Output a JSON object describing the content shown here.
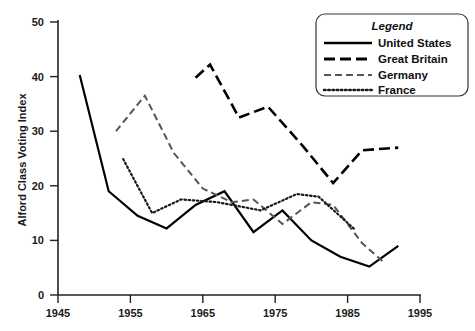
{
  "chart_data": {
    "type": "line",
    "title": "",
    "xlabel": "",
    "ylabel": "Alford Class Voting Index",
    "xlim": [
      1945,
      1995
    ],
    "ylim": [
      0,
      50
    ],
    "xticks": [
      1945,
      1955,
      1965,
      1975,
      1985,
      1995
    ],
    "yticks": [
      0,
      10,
      20,
      30,
      40,
      50
    ],
    "grid": false,
    "legend_position": "top-right",
    "legend_title": "Legend",
    "series": [
      {
        "name": "United States",
        "style": "solid",
        "color": "#000000",
        "x": [
          1948,
          1952,
          1956,
          1960,
          1964,
          1968,
          1972,
          1976,
          1980,
          1984,
          1988,
          1992
        ],
        "y": [
          40.3,
          19.0,
          14.5,
          12.2,
          16.5,
          19.0,
          11.5,
          15.5,
          10.0,
          7.0,
          5.2,
          9.0
        ]
      },
      {
        "name": "Great Britain",
        "style": "long-dash",
        "color": "#000000",
        "x": [
          1964,
          1966,
          1970,
          1974,
          1979,
          1983,
          1987,
          1992
        ],
        "y": [
          39.8,
          42.2,
          32.5,
          34.5,
          27.0,
          20.5,
          26.5,
          27.0
        ]
      },
      {
        "name": "Germany",
        "style": "dash",
        "color": "#555555",
        "x": [
          1953,
          1957,
          1961,
          1965,
          1969,
          1972,
          1976,
          1980,
          1983,
          1987,
          1990
        ],
        "y": [
          30.0,
          36.5,
          26.0,
          19.5,
          17.0,
          17.5,
          13.0,
          17.0,
          16.5,
          9.5,
          6.0
        ]
      },
      {
        "name": "France",
        "style": "dot",
        "color": "#1a1a1a",
        "x": [
          1954,
          1958,
          1962,
          1967,
          1973,
          1978,
          1981,
          1986
        ],
        "y": [
          24.9,
          15.0,
          17.5,
          17.0,
          15.5,
          18.5,
          18.0,
          12.0
        ]
      }
    ]
  },
  "legend": {
    "title": "Legend",
    "entries": [
      {
        "label": "United States",
        "swatch": "solid-line-swatch"
      },
      {
        "label": "Great Britain",
        "swatch": "long-dash-line-swatch"
      },
      {
        "label": "Germany",
        "swatch": "dash-line-swatch"
      },
      {
        "label": "France",
        "swatch": "dotted-line-swatch"
      }
    ]
  },
  "axes": {
    "y_title": "Alford Class Voting Index",
    "y_tick_labels": [
      "50",
      "40",
      "30",
      "20",
      "10",
      "0"
    ],
    "x_tick_labels": [
      "1945",
      "1955",
      "1965",
      "1975",
      "1985",
      "1995"
    ]
  }
}
